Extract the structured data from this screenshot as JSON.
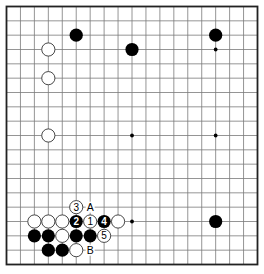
{
  "diagram": {
    "type": "go-board",
    "size": 19,
    "colors": {
      "background": "#ffffff",
      "grid": "#7a7a7a",
      "border": "#222222",
      "black_stone": "#000000",
      "white_stone": "#ffffff",
      "white_outline": "#333333"
    },
    "star_points": [
      [
        15,
        3
      ],
      [
        9,
        9
      ],
      [
        15,
        9
      ],
      [
        9,
        15
      ]
    ],
    "stones": [
      {
        "color": "black",
        "col": 5,
        "row": 2
      },
      {
        "color": "black",
        "col": 15,
        "row": 2
      },
      {
        "color": "white",
        "col": 3,
        "row": 3
      },
      {
        "color": "black",
        "col": 9,
        "row": 3
      },
      {
        "color": "white",
        "col": 3,
        "row": 5
      },
      {
        "color": "white",
        "col": 3,
        "row": 9
      },
      {
        "color": "white",
        "col": 2,
        "row": 15
      },
      {
        "color": "white",
        "col": 3,
        "row": 15
      },
      {
        "color": "white",
        "col": 4,
        "row": 15
      },
      {
        "color": "black",
        "col": 5,
        "row": 15,
        "label": "2"
      },
      {
        "color": "white",
        "col": 6,
        "row": 15,
        "label": "1"
      },
      {
        "color": "black",
        "col": 7,
        "row": 15,
        "label": "4"
      },
      {
        "color": "white",
        "col": 8,
        "row": 15
      },
      {
        "color": "black",
        "col": 15,
        "row": 15
      },
      {
        "color": "white",
        "col": 5,
        "row": 14,
        "label": "3"
      },
      {
        "color": "black",
        "col": 2,
        "row": 16
      },
      {
        "color": "black",
        "col": 3,
        "row": 16
      },
      {
        "color": "white",
        "col": 4,
        "row": 16
      },
      {
        "color": "black",
        "col": 5,
        "row": 16
      },
      {
        "color": "black",
        "col": 6,
        "row": 16
      },
      {
        "color": "white",
        "col": 7,
        "row": 16,
        "label": "5"
      },
      {
        "color": "black",
        "col": 3,
        "row": 17
      },
      {
        "color": "black",
        "col": 4,
        "row": 17
      },
      {
        "color": "white",
        "col": 5,
        "row": 17
      }
    ],
    "letters": [
      {
        "text": "A",
        "col": 6,
        "row": 14
      },
      {
        "text": "B",
        "col": 6,
        "row": 17
      }
    ]
  }
}
